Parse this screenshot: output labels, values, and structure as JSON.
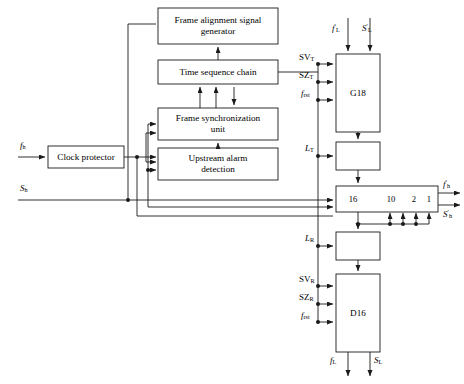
{
  "diagram": {
    "stroke_color": "#1a1a1a",
    "fill_color": "#ffffff",
    "blocks": [
      {
        "id": "frame_alignment_signal_generator",
        "label": "Frame alignment signal\ngenerator",
        "x": 158,
        "y": 8,
        "w": 120,
        "h": 36
      },
      {
        "id": "time_sequence_chain",
        "label": "Time sequence chain",
        "x": 158,
        "y": 60,
        "w": 120,
        "h": 24
      },
      {
        "id": "frame_synchronization_unit",
        "label": "Frame synchronization\nunit",
        "x": 158,
        "y": 108,
        "w": 120,
        "h": 32
      },
      {
        "id": "upstream_alarm_detection",
        "label": "Upstream alarm\ndetection",
        "x": 158,
        "y": 148,
        "w": 120,
        "h": 32
      },
      {
        "id": "clock_protector",
        "label": "Clock protector",
        "x": 48,
        "y": 146,
        "w": 76,
        "h": 22
      },
      {
        "id": "g18",
        "label": "G18",
        "x": 336,
        "y": 54,
        "w": 44,
        "h": 78
      },
      {
        "id": "buffer_top",
        "label": "",
        "x": 336,
        "y": 142,
        "w": 44,
        "h": 28
      },
      {
        "id": "shift_register",
        "label": "",
        "x": 336,
        "y": 186,
        "w": 102,
        "h": 26
      },
      {
        "id": "buffer_bottom",
        "label": "",
        "x": 336,
        "y": 232,
        "w": 44,
        "h": 28
      },
      {
        "id": "d16",
        "label": "D16",
        "x": 336,
        "y": 274,
        "w": 44,
        "h": 78
      }
    ],
    "shift_register_taps": [
      {
        "label": "16",
        "x": 352
      },
      {
        "label": "10",
        "x": 396
      },
      {
        "label": "2",
        "x": 418
      },
      {
        "label": "1",
        "x": 431
      }
    ],
    "signals": {
      "input_fh": "f_h",
      "input_Sh": "S_h",
      "g18_top_fL": "f'_L",
      "g18_top_SL": "S'_L",
      "g18_sv": "SV_T",
      "g18_sz": "SZ_T",
      "g18_frst": "f_rst",
      "lt": "L_T",
      "lr": "L_R",
      "d16_sv": "SV_R",
      "d16_sz": "SZ_R",
      "d16_frst": "f_rst",
      "out_fh": "f'_h",
      "out_Sh": "S'_h",
      "out_fL": "f_L",
      "out_SL": "S_L"
    },
    "labels": {
      "fh": {
        "base": "f",
        "sub": "h",
        "prime": ""
      },
      "Sh": {
        "base": "S",
        "sub": "h",
        "prime": ""
      },
      "fL_prime": {
        "base": "f",
        "sub": "L",
        "prime": "'"
      },
      "SL_prime": {
        "base": "S",
        "sub": "L",
        "prime": "'"
      },
      "SVt": {
        "base": "SV",
        "sub": "T",
        "prime": ""
      },
      "SZt": {
        "base": "SZ",
        "sub": "T",
        "prime": ""
      },
      "frst_t": {
        "base": "f",
        "sub": "rst",
        "prime": ""
      },
      "LT": {
        "base": "L",
        "sub": "T",
        "prime": ""
      },
      "LR": {
        "base": "L",
        "sub": "R",
        "prime": ""
      },
      "SVr": {
        "base": "SV",
        "sub": "R",
        "prime": ""
      },
      "SZr": {
        "base": "SZ",
        "sub": "R",
        "prime": ""
      },
      "frst_r": {
        "base": "f",
        "sub": "rst",
        "prime": ""
      },
      "fh_prime_out": {
        "base": "f",
        "sub": "h",
        "prime": "'"
      },
      "Sh_prime_out": {
        "base": "S",
        "sub": "h",
        "prime": "'"
      },
      "fL_out": {
        "base": "f",
        "sub": "L",
        "prime": ""
      },
      "SL_out": {
        "base": "S",
        "sub": "L",
        "prime": ""
      }
    },
    "block_text": {
      "fasg_line1": "Frame alignment signal",
      "fasg_line2": "generator",
      "tsc": "Time sequence chain",
      "fsu_line1": "Frame synchronization",
      "fsu_line2": "unit",
      "uad_line1": "Upstream alarm",
      "uad_line2": "detection",
      "clock_protector": "Clock protector",
      "g18": "G18",
      "d16": "D16",
      "tap16": "16",
      "tap10": "10",
      "tap2": "2",
      "tap1": "1"
    }
  }
}
